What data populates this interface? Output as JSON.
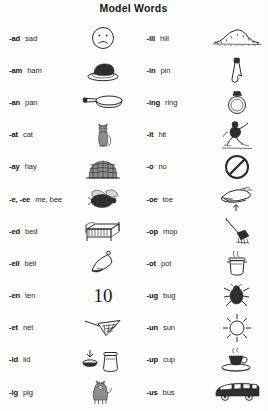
{
  "title": "Model Words",
  "columns": [
    {
      "name": "left-column",
      "rows": [
        {
          "rime": "-ad",
          "word": "sad",
          "icon": "sad-face-icon"
        },
        {
          "rime": "-am",
          "word": "ham",
          "icon": "ham-on-plate-icon"
        },
        {
          "rime": "-an",
          "word": "pan",
          "icon": "frying-pan-icon"
        },
        {
          "rime": "-at",
          "word": "cat",
          "icon": "cat-icon"
        },
        {
          "rime": "-ay",
          "word": "hay",
          "icon": "haystack-icon"
        },
        {
          "rime": "-e, -ee",
          "word": "me, bee",
          "icon": "bee-icon"
        },
        {
          "rime": "-ed",
          "word": "bed",
          "icon": "bed-icon"
        },
        {
          "rime": "-ell",
          "word": "bell",
          "icon": "bell-icon"
        },
        {
          "rime": "-en",
          "word": "ten",
          "icon": "numeral-ten",
          "numeral": "10"
        },
        {
          "rime": "-et",
          "word": "net",
          "icon": "net-icon"
        },
        {
          "rime": "-id",
          "word": "lid",
          "icon": "lid-and-jar-icon"
        },
        {
          "rime": "-ig",
          "word": "pig",
          "icon": "pig-icon"
        }
      ]
    },
    {
      "name": "right-column",
      "rows": [
        {
          "rime": "-ill",
          "word": "hill",
          "icon": "hill-icon"
        },
        {
          "rime": "-in",
          "word": "pin",
          "icon": "safety-pin-icon"
        },
        {
          "rime": "-ing",
          "word": "ring",
          "icon": "ring-icon"
        },
        {
          "rime": "-it",
          "word": "hit",
          "icon": "batter-hitting-icon"
        },
        {
          "rime": "-o",
          "word": "no",
          "icon": "no-sign-icon"
        },
        {
          "rime": "-oe",
          "word": "toe",
          "icon": "toe-icon"
        },
        {
          "rime": "-op",
          "word": "mop",
          "icon": "mop-icon"
        },
        {
          "rime": "-ot",
          "word": "pot",
          "icon": "pot-icon"
        },
        {
          "rime": "-ug",
          "word": "bug",
          "icon": "bug-icon"
        },
        {
          "rime": "-un",
          "word": "sun",
          "icon": "sun-icon"
        },
        {
          "rime": "-up",
          "word": "cup",
          "icon": "cup-icon"
        },
        {
          "rime": "-us",
          "word": "bus",
          "icon": "bus-icon"
        }
      ]
    }
  ],
  "colors": {
    "page_background": "#fdfdfc",
    "ink": "#2b2b2b",
    "title_text": "#161616"
  }
}
